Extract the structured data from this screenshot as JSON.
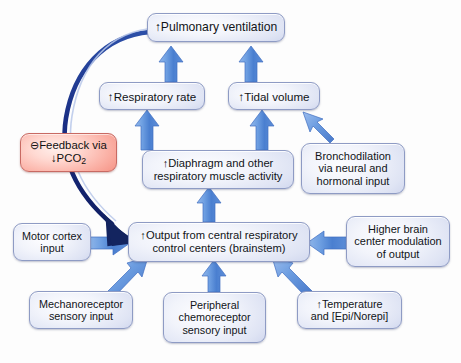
{
  "diagram": {
    "background_color": "#fdfdfd",
    "node_fill_accent": "#b3bde2",
    "node_border_color": "#8e9bc4",
    "feedback_fill_accent": "#ec6d5e",
    "feedback_border_color": "#c86a63",
    "arrow_color": "#5b8fdb",
    "feedback_arrow_color": "#14246e",
    "up_arrow_glyph": "↑",
    "down_arrow_glyph": "↓",
    "minus_circle_glyph": "⊖"
  },
  "nodes": [
    {
      "id": "pulmonary-ventilation",
      "lines": [
        "↑Pulmonary ventilation"
      ],
      "type": "normal"
    },
    {
      "id": "respiratory-rate",
      "lines": [
        "↑Respiratory rate"
      ],
      "type": "normal"
    },
    {
      "id": "tidal-volume",
      "lines": [
        "↑Tidal volume"
      ],
      "type": "normal"
    },
    {
      "id": "feedback",
      "lines": [
        "⊖Feedback via",
        "↓PCO2"
      ],
      "type": "feedback"
    },
    {
      "id": "diaphragm",
      "lines": [
        "↑Diaphragm and other",
        "respiratory muscle activity"
      ],
      "type": "normal"
    },
    {
      "id": "bronchodilation",
      "lines": [
        "Bronchodilation",
        "via neural and",
        "hormonal input"
      ],
      "type": "normal"
    },
    {
      "id": "motor-cortex",
      "lines": [
        "Motor cortex",
        "input"
      ],
      "type": "normal"
    },
    {
      "id": "central-output",
      "lines": [
        "↑Output from central respiratory",
        "control centers (brainstem)"
      ],
      "type": "normal"
    },
    {
      "id": "higher-brain",
      "lines": [
        "Higher brain",
        "center modulation",
        "of output"
      ],
      "type": "normal"
    },
    {
      "id": "mechanoreceptor",
      "lines": [
        "Mechanoreceptor",
        "sensory input"
      ],
      "type": "normal"
    },
    {
      "id": "peripheral-chemoreceptor",
      "lines": [
        "Peripheral",
        "chemoreceptor",
        "sensory input"
      ],
      "type": "normal"
    },
    {
      "id": "temperature",
      "lines": [
        "↑Temperature",
        "and [Epi/Norepi]"
      ],
      "type": "normal"
    }
  ],
  "node_text": {
    "pulmonary_ventilation": "↑Pulmonary ventilation",
    "respiratory_rate": "↑Respiratory rate",
    "tidal_volume": "↑Tidal volume",
    "feedback_line1": "⊖Feedback via",
    "feedback_line2_prefix": "↓PCO",
    "feedback_line2_sub": "2",
    "diaphragm_line1": "↑Diaphragm and other",
    "diaphragm_line2": "respiratory muscle activity",
    "bronchodilation_line1": "Bronchodilation",
    "bronchodilation_line2": "via neural and",
    "bronchodilation_line3": "hormonal input",
    "motor_cortex_line1": "Motor cortex",
    "motor_cortex_line2": "input",
    "central_output_line1": "↑Output from central respiratory",
    "central_output_line2": "control centers (brainstem)",
    "higher_brain_line1": "Higher brain",
    "higher_brain_line2": "center modulation",
    "higher_brain_line3": "of output",
    "mechanoreceptor_line1": "Mechanoreceptor",
    "mechanoreceptor_line2": "sensory input",
    "peripheral_line1": "Peripheral",
    "peripheral_line2": "chemoreceptor",
    "peripheral_line3": "sensory input",
    "temperature_line1": "↑Temperature",
    "temperature_line2": "and [Epi/Norepi]"
  },
  "edges": [
    {
      "id": "diaphragm-to-respiratory-rate",
      "from": "diaphragm",
      "to": "respiratory-rate"
    },
    {
      "id": "diaphragm-to-tidal-volume",
      "from": "diaphragm",
      "to": "tidal-volume"
    },
    {
      "id": "bronchodilation-to-tidal-volume",
      "from": "bronchodilation",
      "to": "tidal-volume"
    },
    {
      "id": "respiratory-rate-to-pulmonary-ventilation",
      "from": "respiratory-rate",
      "to": "pulmonary-ventilation"
    },
    {
      "id": "tidal-volume-to-pulmonary-ventilation",
      "from": "tidal-volume",
      "to": "pulmonary-ventilation"
    },
    {
      "id": "central-output-to-diaphragm",
      "from": "central-output",
      "to": "diaphragm"
    },
    {
      "id": "motor-cortex-to-central-output",
      "from": "motor-cortex",
      "to": "central-output"
    },
    {
      "id": "higher-brain-to-central-output",
      "from": "higher-brain",
      "to": "central-output"
    },
    {
      "id": "mechanoreceptor-to-central-output",
      "from": "mechanoreceptor",
      "to": "central-output"
    },
    {
      "id": "peripheral-chemoreceptor-to-central-output",
      "from": "peripheral-chemoreceptor",
      "to": "central-output"
    },
    {
      "id": "temperature-to-central-output",
      "from": "temperature",
      "to": "central-output"
    },
    {
      "id": "pulmonary-ventilation-feedback-to-central-output",
      "from": "pulmonary-ventilation",
      "to": "central-output",
      "style": "negative-feedback"
    }
  ]
}
